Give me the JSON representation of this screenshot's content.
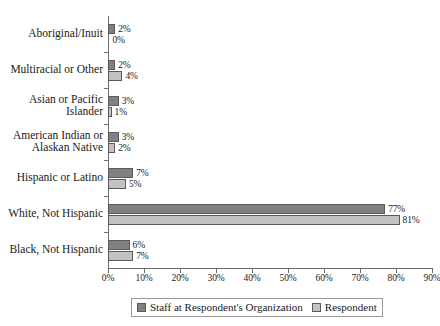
{
  "chart_data": {
    "type": "bar",
    "orientation": "horizontal",
    "title": "",
    "subtitle": "",
    "xlabel": "",
    "ylabel": "",
    "xlim": [
      0,
      90
    ],
    "xtick_labels": [
      "0%",
      "10%",
      "20%",
      "30%",
      "40%",
      "50%",
      "60%",
      "70%",
      "80%",
      "90%"
    ],
    "xtick_values": [
      0,
      10,
      20,
      30,
      40,
      50,
      60,
      70,
      80,
      90
    ],
    "grid": false,
    "legend_position": "bottom-center",
    "value_label_suffix": "%",
    "categories": [
      "Aboriginal/Inuit",
      "Multiracial or Other",
      "Asian or Pacific\nIslander",
      "American Indian or\nAlaskan Native",
      "Hispanic or Latino",
      "White, Not Hispanic",
      "Black, Not Hispanic"
    ],
    "series": [
      {
        "name": "Staff at Respondent's Organization",
        "color": "#808080",
        "values": [
          2,
          2,
          3,
          3,
          7,
          77,
          6
        ],
        "value_labels": [
          "2%",
          "2%",
          "3%",
          "3%",
          "7%",
          "77%",
          "6%"
        ]
      },
      {
        "name": "Respondent",
        "color": "#c2c2c2",
        "values": [
          0,
          4,
          1,
          2,
          5,
          81,
          7
        ],
        "value_labels": [
          "0%",
          "4%",
          "1%",
          "2%",
          "5%",
          "81%",
          "7%"
        ]
      }
    ]
  },
  "legend": {
    "items": [
      {
        "label": "Staff at Respondent's Organization",
        "swatch": "#808080"
      },
      {
        "label": "Respondent",
        "swatch": "#c2c2c2"
      }
    ]
  },
  "colors": {
    "series_staff": "#808080",
    "series_respondent": "#c2c2c2",
    "axis": "#6d6d6d",
    "text": "#1a1a1a",
    "background": "#ffffff"
  }
}
